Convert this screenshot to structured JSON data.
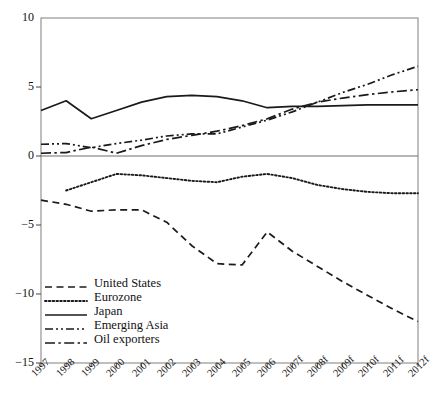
{
  "chart_data": {
    "type": "line",
    "title": "",
    "xlabel": "",
    "ylabel": "",
    "x": [
      "1997",
      "1998",
      "1999",
      "2000",
      "2001",
      "2002",
      "2003",
      "2004",
      "2005",
      "2006",
      "2007f",
      "2008f",
      "2009f",
      "2010f",
      "2011f",
      "2012f"
    ],
    "ylim": [
      -15,
      10
    ],
    "yticks": [
      10,
      5,
      0,
      -5,
      -10,
      -15
    ],
    "ytick_labels": [
      "10",
      "5",
      "0",
      "−5",
      "−10",
      "−15"
    ],
    "grid": false,
    "zero_line": true,
    "legend_position": "lower-left-inside",
    "series": [
      {
        "name": "United States",
        "style": "dashed",
        "values": [
          -3.2,
          -3.5,
          -4.0,
          -3.9,
          -3.9,
          -4.8,
          -6.5,
          -7.8,
          -7.9,
          -5.5,
          -6.9,
          -8.0,
          -9.1,
          -10.1,
          -11.1,
          -12.0
        ]
      },
      {
        "name": "Eurozone",
        "style": "dotted",
        "values": [
          null,
          -2.5,
          -1.9,
          -1.3,
          -1.4,
          -1.6,
          -1.8,
          -1.9,
          -1.5,
          -1.3,
          -1.6,
          -2.1,
          -2.4,
          -2.6,
          -2.7,
          -2.7
        ]
      },
      {
        "name": "Japan",
        "style": "solid",
        "values": [
          3.3,
          4.0,
          2.7,
          3.3,
          3.9,
          4.3,
          4.4,
          4.3,
          4.0,
          3.5,
          3.6,
          3.6,
          3.65,
          3.7,
          3.7,
          3.7
        ]
      },
      {
        "name": "Emerging Asia",
        "style": "dash-dot-dot",
        "values": [
          0.85,
          0.9,
          0.6,
          0.9,
          1.15,
          1.45,
          1.6,
          1.6,
          2.1,
          2.6,
          3.2,
          3.9,
          4.6,
          5.2,
          5.9,
          6.5
        ]
      },
      {
        "name": "Oil exporters",
        "style": "dash-dot",
        "values": [
          0.2,
          0.25,
          0.65,
          0.2,
          0.75,
          1.2,
          1.5,
          1.8,
          2.2,
          2.7,
          3.4,
          3.9,
          4.2,
          4.45,
          4.65,
          4.8
        ]
      }
    ]
  },
  "legend": {
    "items": [
      {
        "label": "United States"
      },
      {
        "label": "Eurozone"
      },
      {
        "label": "Japan"
      },
      {
        "label": "Emerging Asia"
      },
      {
        "label": "Oil exporters"
      }
    ]
  }
}
